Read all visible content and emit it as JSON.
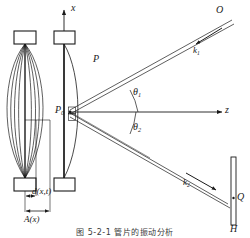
{
  "figure": {
    "caption": "图 5-2-1   管片的振动分析",
    "axes": {
      "vertical_label": "x",
      "horizontal_label": "z"
    },
    "points": {
      "origin": "P",
      "origin_sub": "0",
      "beam_point": "P",
      "source": "O",
      "screen_point": "Q",
      "screen_label": "H"
    },
    "angles": [
      {
        "name": "theta1",
        "label": "θ",
        "sub": "1",
        "value_deg": 28
      },
      {
        "name": "theta2",
        "label": "θ",
        "sub": "2",
        "value_deg": -26
      }
    ],
    "wavevectors": [
      {
        "name": "k1",
        "label": "k",
        "sub": "1"
      },
      {
        "name": "k2",
        "label": "k",
        "sub": "2"
      }
    ],
    "dimensions": [
      {
        "name": "displacement",
        "label": "d(x,t)"
      },
      {
        "name": "amplitude",
        "label": "A(x)"
      }
    ],
    "colors": {
      "stroke": "#1a1a1a",
      "light": "#4a4a4a",
      "background": "#ffffff"
    }
  }
}
